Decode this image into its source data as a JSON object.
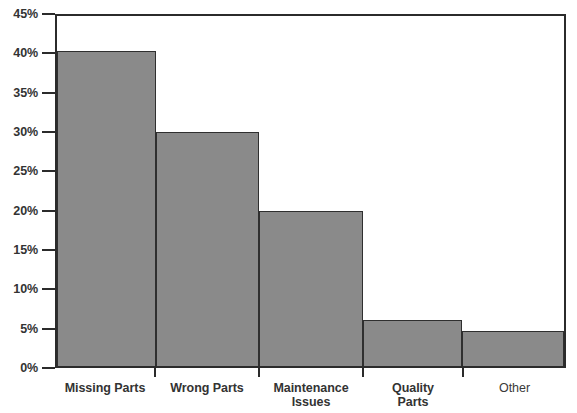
{
  "chart_data": {
    "type": "bar",
    "title": "",
    "subtitle": "",
    "xlabel": "",
    "ylabel": "",
    "categories": [
      "Missing Parts",
      "Wrong Parts",
      "Maintenance\nIssues",
      "Quality\nParts",
      "Other"
    ],
    "values": [
      40.0,
      29.7,
      19.7,
      5.9,
      4.4
    ],
    "value_labels": [
      "40%",
      "29.7%",
      "19.7%",
      "5.9%",
      "4.4%"
    ],
    "ylim": [
      0,
      45
    ],
    "ytick_labels": [
      "0%",
      "5%",
      "10%",
      "15%",
      "20%",
      "25%",
      "30%",
      "35%",
      "40%",
      "45%"
    ],
    "ytick_values": [
      0,
      5,
      10,
      15,
      20,
      25,
      30,
      35,
      40,
      45
    ],
    "grid": false,
    "legend": null,
    "legend_position": "none",
    "annotations": [],
    "colors": {
      "bar_fill": "#8a8a8a",
      "bar_border": "#2f2f2f",
      "axis": "#2b2b2b",
      "text": "#333333",
      "background": "#ffffff"
    },
    "category_widths_px": [
      100,
      104,
      104,
      100,
      103
    ]
  }
}
